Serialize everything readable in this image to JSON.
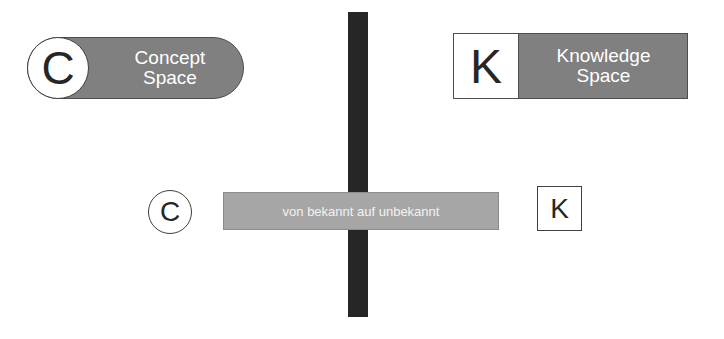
{
  "concept_space": {
    "letter": "C",
    "label_line1": "Concept",
    "label_line2": "Space"
  },
  "knowledge_space": {
    "letter": "K",
    "label_line1": "Knowledge",
    "label_line2": "Space"
  },
  "transition": {
    "from_letter": "C",
    "to_letter": "K",
    "bar_label": "von bekannt auf unbekannt"
  },
  "colors": {
    "dark_bar": "#262626",
    "box_fill": "#808080",
    "transition_bar": "#a6a6a6"
  }
}
